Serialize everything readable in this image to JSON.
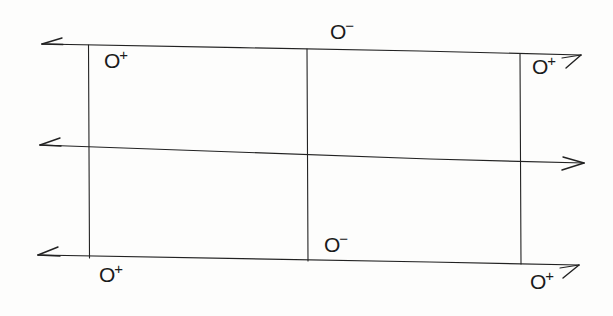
{
  "figure": {
    "kind": "hand-drawn-line-diagram",
    "width": 613,
    "height": 316,
    "background_color": "#fdfdfc",
    "ink_color": "#222222",
    "stroke_width": 1.1
  },
  "lines": {
    "horizontal": [
      {
        "name": "top-axis-line",
        "x1": 42,
        "y1": 44,
        "x2": 581,
        "y2": 55,
        "arrow_start": "left",
        "arrow_end": "up-right"
      },
      {
        "name": "middle-axis-line",
        "x1": 40,
        "y1": 145,
        "x2": 584,
        "y2": 163,
        "arrow_start": "left",
        "arrow_end": "right"
      },
      {
        "name": "bottom-axis-line",
        "x1": 38,
        "y1": 255,
        "x2": 579,
        "y2": 265,
        "arrow_start": "left",
        "arrow_end": "up-right"
      }
    ],
    "vertical": [
      {
        "name": "left-rail",
        "x1": 88,
        "y1": 45,
        "x2": 90,
        "y2": 258
      },
      {
        "name": "center-rail",
        "x1": 307,
        "y1": 49,
        "x2": 308,
        "y2": 261
      },
      {
        "name": "right-rail",
        "x1": 520,
        "y1": 54,
        "x2": 521,
        "y2": 264
      }
    ]
  },
  "charges": [
    {
      "name": "charge-top-left-positive",
      "symbol": "O",
      "sign": "+",
      "x": 104,
      "y": 44,
      "value": "O+"
    },
    {
      "name": "charge-top-center-negative",
      "symbol": "O",
      "sign": "−",
      "x": 330,
      "y": 15,
      "value": "O−"
    },
    {
      "name": "charge-top-right-positive",
      "symbol": "O",
      "sign": "+",
      "x": 532,
      "y": 50,
      "value": "O+"
    },
    {
      "name": "charge-bottom-center-negative",
      "symbol": "O",
      "sign": "−",
      "x": 324,
      "y": 228,
      "value": "O−"
    },
    {
      "name": "charge-bottom-left-positive",
      "symbol": "O",
      "sign": "+",
      "x": 99,
      "y": 258,
      "value": "O+"
    },
    {
      "name": "charge-bottom-right-positive",
      "symbol": "O",
      "sign": "+",
      "x": 530,
      "y": 265,
      "value": "O+"
    }
  ]
}
